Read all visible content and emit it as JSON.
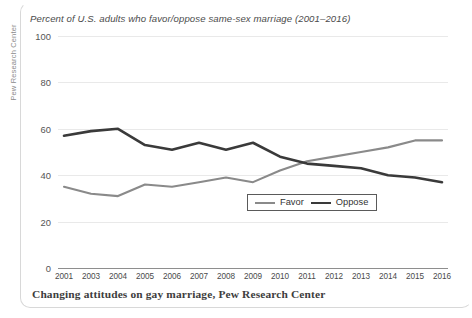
{
  "vaxis_title": "Pew Research Center",
  "caption": "Changing attitudes on gay marriage, Pew Research Center",
  "legend": {
    "favor_label": "Favor",
    "oppose_label": "Oppose",
    "position": "inside-bottom-right"
  },
  "colors": {
    "favor": "#8a8a8a",
    "oppose": "#3a3a3a",
    "grid": "#e9e9e9",
    "axis": "#8e8e8e",
    "text": "#4a4a4a",
    "frame": "#d8d8d8"
  },
  "chart_data": {
    "type": "line",
    "title": "Percent of U.S. adults who favor/oppose same-sex marriage (2001–2016)",
    "xlabel": "",
    "ylabel": "",
    "ylim": [
      0,
      100
    ],
    "yticks": [
      0,
      20,
      40,
      60,
      80,
      100
    ],
    "grid": true,
    "categories": [
      "2001",
      "2003",
      "2004",
      "2005",
      "2006",
      "2007",
      "2008",
      "2009",
      "2010",
      "2011",
      "2012",
      "2013",
      "2014",
      "2015",
      "2016"
    ],
    "series": [
      {
        "name": "Favor",
        "color": "#8a8a8a",
        "values": [
          35,
          32,
          31,
          36,
          35,
          37,
          39,
          37,
          42,
          46,
          48,
          50,
          52,
          55,
          55
        ]
      },
      {
        "name": "Oppose",
        "color": "#3a3a3a",
        "values": [
          57,
          59,
          60,
          53,
          51,
          54,
          51,
          54,
          48,
          45,
          44,
          43,
          40,
          39,
          37
        ]
      }
    ],
    "annotations": []
  }
}
